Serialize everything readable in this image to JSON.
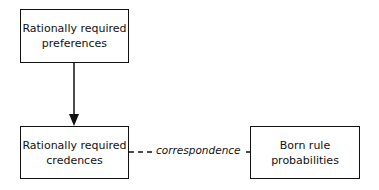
{
  "diagram": {
    "nodes": [
      {
        "id": "preferences",
        "line1": "Rationally required",
        "line2": "preferences"
      },
      {
        "id": "credences",
        "line1": "Rationally required",
        "line2": "credences"
      },
      {
        "id": "born",
        "line1": "Born rule",
        "line2": "probabilities"
      }
    ],
    "edges": [
      {
        "from": "preferences",
        "to": "credences",
        "style": "solid-arrow",
        "label": ""
      },
      {
        "from": "credences",
        "to": "born",
        "style": "dashed",
        "label": "correspondence"
      }
    ],
    "colors": {
      "stroke": "#111111",
      "background": "#ffffff"
    }
  }
}
